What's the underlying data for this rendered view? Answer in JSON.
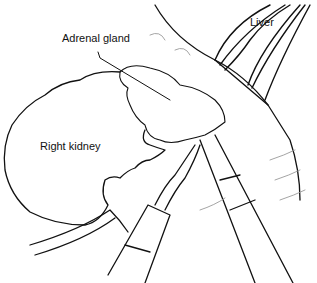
{
  "figure": {
    "labels": {
      "liver": "Liver",
      "adrenal_gland": "Adrenal gland",
      "right_kidney": "Right kidney"
    },
    "colors": {
      "stroke": "#111111",
      "faint": "#9a9a9a",
      "background": "#ffffff"
    }
  }
}
